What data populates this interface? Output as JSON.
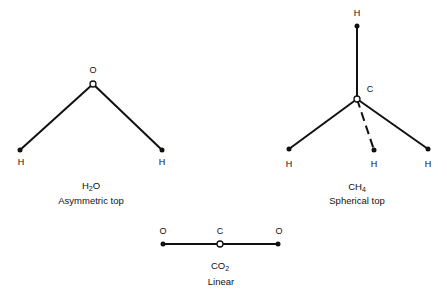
{
  "molecules": {
    "h2o": {
      "formula_main": "H",
      "formula_sub": "2",
      "formula_end": "O",
      "type": "Asymmetric top",
      "atoms": {
        "center": "O",
        "left": "H",
        "right": "H"
      }
    },
    "ch4": {
      "formula_main": "CH",
      "formula_sub": "4",
      "type": "Spherical top",
      "atoms": {
        "center": "C",
        "top": "H",
        "left": "H",
        "middle": "H",
        "right": "H"
      }
    },
    "co2": {
      "formula_main": "CO",
      "formula_sub": "2",
      "type": "Linear",
      "atoms": {
        "left": "O",
        "center": "C",
        "right": "O"
      }
    }
  }
}
